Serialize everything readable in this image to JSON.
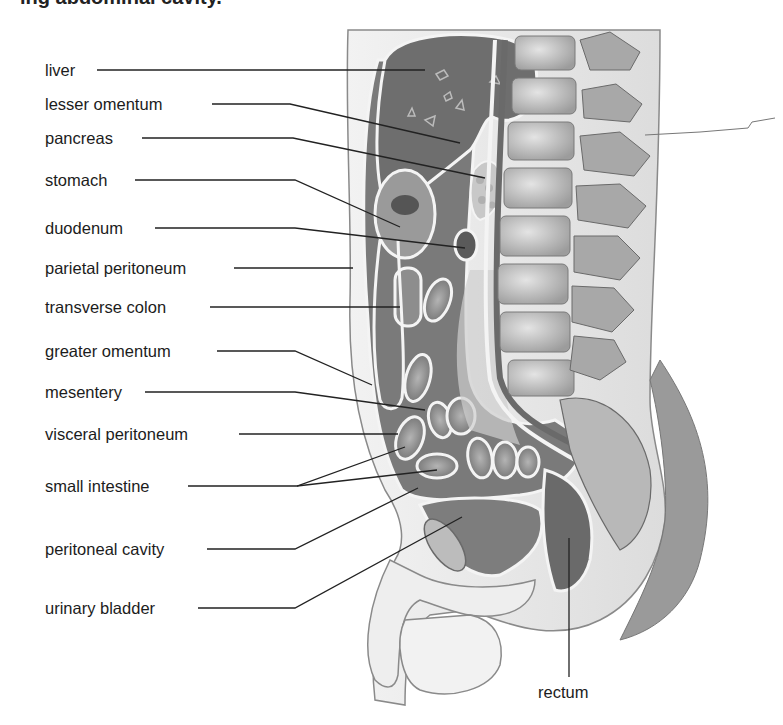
{
  "figure": {
    "title_partial": "ing abdominal cavity.",
    "colors": {
      "background": "#ffffff",
      "label_text": "#1c1c1c",
      "leader_line": "#222222",
      "liver_fill": "#6e6e6e",
      "cavity_fill": "#7a7a7a",
      "membrane_white": "#f4f4f4",
      "vertebra_fill": "#bdbdbd",
      "body_outline": "#8a8a8a",
      "skin_fill": "#eeeeee"
    }
  },
  "labels": [
    {
      "id": "liver",
      "text": "liver",
      "x": 45,
      "y": 60
    },
    {
      "id": "lesser-omentum",
      "text": "lesser omentum",
      "x": 45,
      "y": 94
    },
    {
      "id": "pancreas",
      "text": "pancreas",
      "x": 45,
      "y": 128
    },
    {
      "id": "stomach",
      "text": "stomach",
      "x": 45,
      "y": 170
    },
    {
      "id": "duodenum",
      "text": "duodenum",
      "x": 45,
      "y": 218
    },
    {
      "id": "parietal-peritoneum",
      "text": "parietal peritoneum",
      "x": 45,
      "y": 258
    },
    {
      "id": "transverse-colon",
      "text": "transverse colon",
      "x": 45,
      "y": 297
    },
    {
      "id": "greater-omentum",
      "text": "greater omentum",
      "x": 45,
      "y": 341
    },
    {
      "id": "mesentery",
      "text": "mesentery",
      "x": 45,
      "y": 382
    },
    {
      "id": "visceral-peritoneum",
      "text": "visceral peritoneum",
      "x": 45,
      "y": 424
    },
    {
      "id": "small-intestine",
      "text": "small intestine",
      "x": 45,
      "y": 476
    },
    {
      "id": "peritoneal-cavity",
      "text": "peritoneal cavity",
      "x": 45,
      "y": 539
    },
    {
      "id": "urinary-bladder",
      "text": "urinary bladder",
      "x": 45,
      "y": 598
    },
    {
      "id": "rectum",
      "text": "rectum",
      "x": 538,
      "y": 682
    }
  ],
  "leaders": [
    {
      "for": "liver",
      "points": "97,70 425,70"
    },
    {
      "for": "lesser-omentum",
      "points": "212,104 290,104 460,143"
    },
    {
      "for": "pancreas",
      "points": "142,138 293,138 485,178"
    },
    {
      "for": "stomach",
      "points": "135,180 295,180 400,227"
    },
    {
      "for": "duodenum",
      "points": "155,228 295,228 465,248"
    },
    {
      "for": "parietal-peritoneum",
      "points": "234,268 353,268"
    },
    {
      "for": "transverse-colon",
      "points": "210,307 400,307"
    },
    {
      "for": "greater-omentum",
      "points": "217,351 295,351 372,385"
    },
    {
      "for": "mesentery",
      "points": "145,392 295,392 425,410"
    },
    {
      "for": "visceral-peritoneum",
      "points": "239,434 398,434"
    },
    {
      "for": "small-intestine-a",
      "points": "188,486 297,486 405,447"
    },
    {
      "for": "small-intestine-b",
      "points": "297,486 437,470"
    },
    {
      "for": "peritoneal-cavity",
      "points": "207,549 295,549 418,488"
    },
    {
      "for": "urinary-bladder",
      "points": "198,608 295,608 462,517"
    },
    {
      "for": "rectum",
      "points": "569,538 569,677"
    },
    {
      "for": "unlabeled-right",
      "points": "645,135 700,132 748,128 752,122 775,118"
    }
  ]
}
